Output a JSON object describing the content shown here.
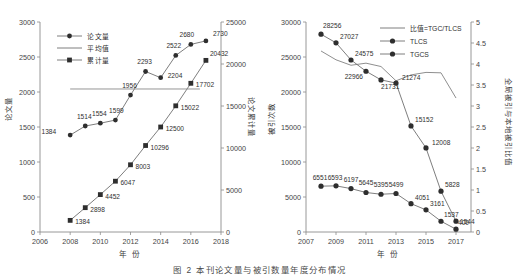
{
  "caption": "图 2  本刊论文量与被引数量年度分布情况",
  "chart_data": [
    {
      "id": "left-panel",
      "type": "line",
      "title": "",
      "xlabel": "年 份",
      "ylabel": "论文量",
      "y2label": "论文累计量",
      "x": [
        2008,
        2009,
        2010,
        2011,
        2012,
        2013,
        2014,
        2015,
        2016,
        2017
      ],
      "xlim": [
        2006,
        2018
      ],
      "xticks": [
        2006,
        2008,
        2010,
        2012,
        2014,
        2016,
        2018
      ],
      "ylim": [
        0,
        3000
      ],
      "yticks": [
        0,
        500,
        1000,
        1500,
        2000,
        2500,
        3000
      ],
      "y2lim": [
        0,
        25000
      ],
      "y2ticks": [
        0,
        5000,
        10000,
        15000,
        20000,
        25000
      ],
      "grid": false,
      "legend_position": "top-left",
      "series": [
        {
          "name": "论文量",
          "axis": "left",
          "marker": "circle",
          "values": [
            1384,
            1514,
            1554,
            1599,
            1956,
            2293,
            2204,
            2522,
            2680,
            2730
          ],
          "labels": [
            "1384",
            "1514",
            "1554",
            "1599",
            "1956",
            "2293",
            "2204",
            "2522",
            "2680",
            "2730"
          ]
        },
        {
          "name": "平均值",
          "axis": "left",
          "marker": "none",
          "value": 2043,
          "span": [
            2008,
            2016.6
          ]
        },
        {
          "name": "累计量",
          "axis": "right",
          "marker": "square",
          "values": [
            1384,
            2898,
            4452,
            6047,
            8003,
            10296,
            12500,
            15022,
            17702,
            20432
          ],
          "labels": [
            "1384",
            "2898",
            "4452",
            "6047",
            "8003",
            "10296",
            "12500",
            "15022",
            "17702",
            "20432"
          ]
        }
      ]
    },
    {
      "id": "right-panel",
      "type": "line",
      "title": "",
      "xlabel": "年 份",
      "ylabel": "被引次数",
      "y2label": "全局被引与本地被引比值",
      "x": [
        2008,
        2009,
        2010,
        2011,
        2012,
        2013,
        2014,
        2015,
        2016,
        2017
      ],
      "xlim": [
        2007,
        2018
      ],
      "xticks": [
        2007,
        2009,
        2011,
        2013,
        2015,
        2017
      ],
      "ylim": [
        0,
        30000
      ],
      "yticks": [
        0,
        5000,
        10000,
        15000,
        20000,
        25000,
        30000
      ],
      "y2lim": [
        0,
        5
      ],
      "y2ticks": [
        0,
        0.5,
        1,
        1.5,
        2,
        2.5,
        3,
        3.5,
        4,
        4.5,
        5
      ],
      "grid": false,
      "legend_position": "top-right",
      "series": [
        {
          "name": "比值=TGC/TLCS",
          "axis": "right",
          "marker": "none",
          "values": [
            4.31,
            4.1,
            3.97,
            4.02,
            3.94,
            3.6,
            3.74,
            3.8,
            3.79,
            3.19
          ],
          "labels": []
        },
        {
          "name": "TLCS",
          "axis": "left",
          "marker": "circle",
          "values": [
            6551,
            6593,
            6197,
            5645,
            5395,
            5499,
            4051,
            3161,
            1537,
            400
          ],
          "labels": [
            "6551",
            "6593",
            "6197",
            "5645",
            "5395",
            "5499",
            "4051",
            "3161",
            "1537",
            "400"
          ]
        },
        {
          "name": "TGCS",
          "axis": "left",
          "marker": "circle",
          "values": [
            28256,
            27027,
            24575,
            22966,
            21731,
            21274,
            15152,
            12008,
            5828,
            1544
          ],
          "labels": [
            "28256",
            "27027",
            "24575",
            "22966",
            "21731",
            "21274",
            "15152",
            "12008",
            "5828",
            "1544"
          ]
        }
      ]
    }
  ]
}
